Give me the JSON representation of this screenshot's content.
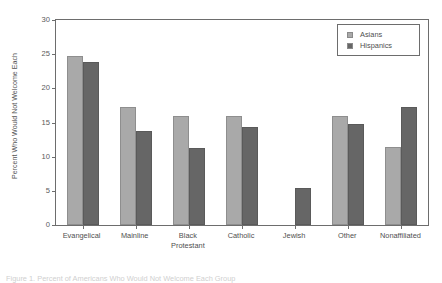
{
  "chart_data": {
    "type": "bar",
    "title": "",
    "xlabel": "",
    "ylabel": "Percent Who Would Not Welcome Each",
    "ylim": [
      0,
      30
    ],
    "ytick_labels": [
      "0",
      "5",
      "10",
      "15",
      "20",
      "25",
      "30"
    ],
    "ytick_values": [
      0,
      5,
      10,
      15,
      20,
      25,
      30
    ],
    "grid": false,
    "legend_position": "top-right",
    "categories": [
      "Evangelical",
      "Mainline",
      "Black Protestant",
      "Catholic",
      "Jewish",
      "Other",
      "Nonaffiliated"
    ],
    "category_lines": [
      [
        "Evangelical"
      ],
      [
        "Mainline"
      ],
      [
        "Black",
        "Protestant"
      ],
      [
        "Catholic"
      ],
      [
        "Jewish"
      ],
      [
        "Other"
      ],
      [
        "Nonaffiliated"
      ]
    ],
    "series": [
      {
        "name": "Asians",
        "color": "#a9a9a9",
        "values": [
          24.7,
          17.2,
          16.0,
          16.0,
          null,
          16.0,
          11.4
        ]
      },
      {
        "name": "Hispanics",
        "color": "#666666",
        "values": [
          23.8,
          13.8,
          11.3,
          14.3,
          5.4,
          14.8,
          17.2
        ]
      }
    ]
  },
  "legend": {
    "entries": [
      {
        "label": "Asians",
        "color": "#a9a9a9"
      },
      {
        "label": "Hispanics",
        "color": "#666666"
      }
    ]
  },
  "caption": {
    "text": "Figure 1. Percent of Americans Who Would Not Welcome Each Group"
  }
}
